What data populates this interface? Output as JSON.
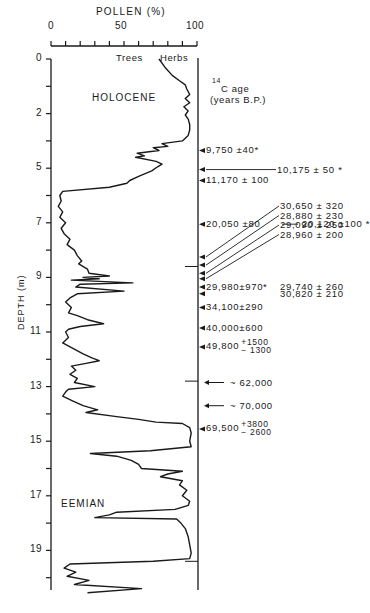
{
  "chart_data": {
    "type": "line",
    "title": "POLLEN (%)",
    "xlabel": "POLLEN (%)",
    "ylabel": "DEPTH (m)",
    "x_ticks": [
      "0",
      "50",
      "100"
    ],
    "xlim": [
      0,
      100
    ],
    "y_tick_labels": [
      "0",
      "2",
      "5",
      "7",
      "9",
      "11",
      "13",
      "15",
      "17",
      "19"
    ],
    "ylim": [
      0,
      19.6
    ],
    "grid": false,
    "curve_labels": {
      "left": "Trees",
      "right": "Herbs"
    },
    "zones": [
      {
        "name": "HOLOCENE",
        "depth": 1.2
      },
      {
        "name": "EEMIAN",
        "depth": 16.3
      }
    ],
    "age_axis_title_sup": "14",
    "age_axis_title_line1": "C age",
    "age_axis_title_line2": "(years B.P.)",
    "series": [
      {
        "name": "Trees pollen boundary (% trees)",
        "points": [
          [
            0.0,
            74
          ],
          [
            0.3,
            78
          ],
          [
            0.6,
            83
          ],
          [
            0.8,
            88
          ],
          [
            0.95,
            92
          ],
          [
            1.1,
            93
          ],
          [
            1.3,
            95
          ],
          [
            1.45,
            92
          ],
          [
            1.6,
            95
          ],
          [
            1.75,
            91
          ],
          [
            1.9,
            94
          ],
          [
            2.05,
            92
          ],
          [
            2.2,
            94
          ],
          [
            2.4,
            95
          ],
          [
            2.6,
            95
          ],
          [
            2.8,
            94
          ],
          [
            3.0,
            90
          ],
          [
            3.1,
            76
          ],
          [
            3.2,
            80
          ],
          [
            3.25,
            70
          ],
          [
            3.35,
            74
          ],
          [
            3.45,
            59
          ],
          [
            3.55,
            64
          ],
          [
            3.6,
            58
          ],
          [
            3.75,
            72
          ],
          [
            3.85,
            76
          ],
          [
            3.95,
            73
          ],
          [
            4.1,
            69
          ],
          [
            4.3,
            60
          ],
          [
            4.45,
            54
          ],
          [
            4.55,
            52
          ],
          [
            4.7,
            40
          ],
          [
            4.85,
            8
          ],
          [
            5.0,
            6
          ],
          [
            5.2,
            7
          ],
          [
            5.4,
            5
          ],
          [
            5.6,
            8
          ],
          [
            5.8,
            6
          ],
          [
            6.0,
            10
          ],
          [
            6.2,
            7
          ],
          [
            6.4,
            9
          ],
          [
            6.6,
            13
          ],
          [
            6.8,
            11
          ],
          [
            7.0,
            16
          ],
          [
            7.2,
            18
          ],
          [
            7.4,
            21
          ],
          [
            7.5,
            19
          ],
          [
            7.7,
            25
          ],
          [
            7.85,
            26
          ],
          [
            7.95,
            40
          ],
          [
            8.0,
            22
          ],
          [
            8.05,
            33
          ],
          [
            8.1,
            14
          ],
          [
            8.2,
            56
          ],
          [
            8.25,
            20
          ],
          [
            8.35,
            17
          ],
          [
            8.5,
            50
          ],
          [
            8.6,
            18
          ],
          [
            8.75,
            13
          ],
          [
            8.9,
            10
          ],
          [
            9.1,
            14
          ],
          [
            9.3,
            12
          ],
          [
            9.4,
            18
          ],
          [
            9.55,
            25
          ],
          [
            9.7,
            36
          ],
          [
            9.8,
            20
          ],
          [
            9.9,
            12
          ],
          [
            10.0,
            10
          ],
          [
            10.2,
            12
          ],
          [
            10.4,
            8
          ],
          [
            10.6,
            15
          ],
          [
            10.8,
            22
          ],
          [
            10.95,
            28
          ],
          [
            11.05,
            33
          ],
          [
            11.15,
            24
          ],
          [
            11.25,
            14
          ],
          [
            11.4,
            17
          ],
          [
            11.55,
            13
          ],
          [
            11.7,
            18
          ],
          [
            11.85,
            16
          ],
          [
            12.0,
            30
          ],
          [
            12.1,
            12
          ],
          [
            12.2,
            10
          ],
          [
            12.35,
            8
          ],
          [
            12.5,
            14
          ],
          [
            12.7,
            22
          ],
          [
            12.85,
            32
          ],
          [
            12.95,
            24
          ],
          [
            13.1,
            45
          ],
          [
            13.2,
            60
          ],
          [
            13.3,
            72
          ],
          [
            13.35,
            90
          ],
          [
            13.5,
            95
          ],
          [
            13.7,
            96
          ],
          [
            14.0,
            95
          ],
          [
            14.2,
            96
          ],
          [
            14.35,
            68
          ],
          [
            14.45,
            27
          ],
          [
            14.55,
            45
          ],
          [
            14.7,
            55
          ],
          [
            14.85,
            60
          ],
          [
            15.0,
            62
          ],
          [
            15.1,
            90
          ],
          [
            15.2,
            80
          ],
          [
            15.3,
            75
          ],
          [
            15.45,
            90
          ],
          [
            15.6,
            88
          ],
          [
            15.8,
            93
          ],
          [
            16.0,
            90
          ],
          [
            16.2,
            95
          ],
          [
            16.35,
            94
          ],
          [
            16.5,
            85
          ],
          [
            16.6,
            45
          ],
          [
            16.7,
            40
          ],
          [
            16.8,
            30
          ],
          [
            16.85,
            86
          ],
          [
            17.0,
            89
          ],
          [
            17.2,
            92
          ],
          [
            17.5,
            94
          ],
          [
            17.8,
            95
          ],
          [
            18.1,
            96
          ],
          [
            18.3,
            95
          ],
          [
            18.4,
            70
          ],
          [
            18.5,
            13
          ],
          [
            18.65,
            9
          ],
          [
            18.8,
            17
          ],
          [
            18.95,
            11
          ],
          [
            19.1,
            26
          ],
          [
            19.25,
            16
          ],
          [
            19.4,
            62
          ],
          [
            19.55,
            25
          ]
        ]
      }
    ],
    "c14_dates": [
      {
        "depth": 3.35,
        "label": "9,750 ±40*"
      },
      {
        "depth": 4.05,
        "label": "10,175 ± 50 *",
        "leader": true
      },
      {
        "depth": 4.45,
        "label": "11,170 ± 100"
      },
      {
        "depth": 6.05,
        "label": "20,050 ±80",
        "extra": "20,120 ±100 *"
      },
      {
        "depth": 7.25,
        "label": "30,650 ± 320",
        "leader": true
      },
      {
        "depth": 7.55,
        "label": "28,880 ± 230",
        "leader": true
      },
      {
        "depth": 7.85,
        "label": "29,090 ± 250",
        "leader": true
      },
      {
        "depth": 8.05,
        "label": "28,960 ± 200",
        "leader": true
      },
      {
        "depth": 8.35,
        "label": "29,980±970*",
        "extra": "29,740 ± 260"
      },
      {
        "depth": 8.6,
        "label": "",
        "extra": "30,820 ± 210"
      },
      {
        "depth": 9.1,
        "label": "34,100±290"
      },
      {
        "depth": 9.85,
        "label": "40,000±600"
      },
      {
        "depth": 10.55,
        "label": "49,800",
        "plus": "+1500",
        "minus": "− 1300"
      },
      {
        "depth": 11.85,
        "label": "~ 62,000",
        "long_arrow": true
      },
      {
        "depth": 12.7,
        "label": "~ 70,000",
        "long_arrow": true
      },
      {
        "depth": 13.55,
        "label": "69,500",
        "plus": "+3800",
        "minus": "− 2600"
      }
    ],
    "horizontal_marks": [
      7.6,
      11.8,
      18.4
    ]
  }
}
